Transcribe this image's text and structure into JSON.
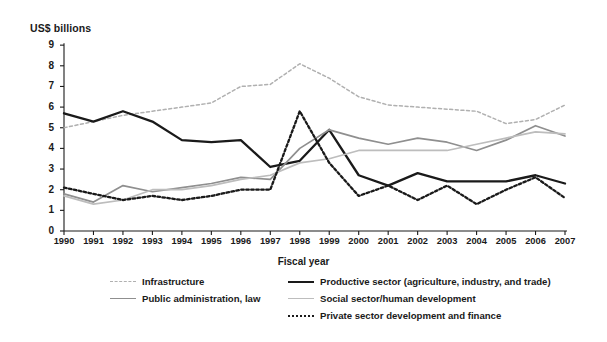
{
  "axis": {
    "y_title": "US$ billions",
    "x_title": "Fiscal year",
    "y_ticks": [
      "0",
      "1",
      "2",
      "3",
      "4",
      "5",
      "6",
      "7",
      "8",
      "9"
    ],
    "x_ticks": [
      "1990",
      "1991",
      "1992",
      "1993",
      "1994",
      "1995",
      "1996",
      "1997",
      "1998",
      "1999",
      "2000",
      "2001",
      "2002",
      "2003",
      "2004",
      "2005",
      "2006",
      "2007"
    ]
  },
  "legend": {
    "row1": [
      {
        "label": "Infrastructure",
        "style": "sw-dot-light"
      },
      {
        "label": "Productive sector (agriculture, industry, and trade)",
        "style": "sw-solid-black"
      }
    ],
    "row2": [
      {
        "label": "Public administration, law",
        "style": "sw-solid-gray"
      },
      {
        "label": "Social sector/human development",
        "style": "sw-solid-lgray"
      }
    ],
    "row3": [
      {
        "label": "Private sector development and finance",
        "style": "sw-dot-black"
      }
    ]
  },
  "colors": {
    "infrastructure": "#b0b0b0",
    "productive": "#1a1a1a",
    "public_admin": "#8f8f8f",
    "social": "#bdbdbd",
    "private": "#1a1a1a",
    "axis": "#1a1a1a",
    "background": "#ffffff"
  },
  "chart_data": {
    "type": "line",
    "title": "",
    "xlabel": "Fiscal year",
    "ylabel": "US$ billions",
    "ylim": [
      0,
      9
    ],
    "grid": false,
    "legend_position": "bottom",
    "x": [
      1990,
      1991,
      1992,
      1993,
      1994,
      1995,
      1996,
      1997,
      1998,
      1999,
      2000,
      2001,
      2002,
      2003,
      2004,
      2005,
      2006,
      2007
    ],
    "categories": [
      "1990",
      "1991",
      "1992",
      "1993",
      "1994",
      "1995",
      "1996",
      "1997",
      "1998",
      "1999",
      "2000",
      "2001",
      "2002",
      "2003",
      "2004",
      "2005",
      "2006",
      "2007"
    ],
    "series": [
      {
        "name": "Infrastructure",
        "style": "dashed",
        "color": "#b0b0b0",
        "values": [
          5.0,
          5.3,
          5.6,
          5.8,
          6.0,
          6.2,
          7.0,
          7.1,
          8.1,
          7.4,
          6.5,
          6.1,
          6.0,
          5.9,
          5.8,
          5.2,
          5.4,
          6.1
        ]
      },
      {
        "name": "Productive sector (agriculture, industry, and trade)",
        "style": "solid-bold",
        "color": "#1a1a1a",
        "values": [
          5.7,
          5.3,
          5.8,
          5.3,
          4.4,
          4.3,
          4.4,
          3.1,
          3.4,
          4.9,
          2.7,
          2.2,
          2.8,
          2.4,
          2.4,
          2.4,
          2.7,
          2.3
        ]
      },
      {
        "name": "Public administration, law",
        "style": "solid",
        "color": "#8f8f8f",
        "values": [
          1.8,
          1.4,
          2.2,
          1.9,
          2.1,
          2.3,
          2.6,
          2.5,
          4.0,
          4.9,
          4.5,
          4.2,
          4.5,
          4.3,
          3.9,
          4.4,
          5.1,
          4.6
        ]
      },
      {
        "name": "Social sector/human development",
        "style": "solid",
        "color": "#bdbdbd",
        "values": [
          1.7,
          1.3,
          1.5,
          2.0,
          2.0,
          2.2,
          2.5,
          2.7,
          3.3,
          3.5,
          3.9,
          3.9,
          3.9,
          3.9,
          4.2,
          4.5,
          4.8,
          4.7
        ]
      },
      {
        "name": "Private sector development and finance",
        "style": "dotted-bold",
        "color": "#1a1a1a",
        "values": [
          2.1,
          1.8,
          1.5,
          1.7,
          1.5,
          1.7,
          2.0,
          2.0,
          5.8,
          3.3,
          1.7,
          2.2,
          1.5,
          2.2,
          1.3,
          2.0,
          2.6,
          1.6
        ]
      }
    ]
  }
}
